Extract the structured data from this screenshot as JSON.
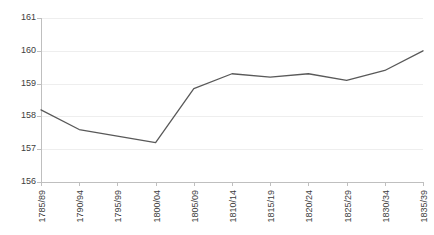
{
  "chart_data": {
    "type": "line",
    "title": "",
    "xlabel": "",
    "ylabel": "",
    "categories": [
      "1785/89",
      "1790/94",
      "1795/99",
      "1800/04",
      "1805/09",
      "1810/14",
      "1815/19",
      "1820/24",
      "1825/29",
      "1830/34",
      "1835/39"
    ],
    "series": [
      {
        "name": "height",
        "values": [
          158.2,
          157.6,
          157.4,
          157.2,
          158.85,
          159.3,
          159.2,
          159.3,
          159.1,
          159.4,
          160.0
        ]
      }
    ],
    "ylim": [
      156,
      161
    ],
    "yticks": [
      156,
      157,
      158,
      159,
      160,
      161
    ],
    "ytick_labels": [
      "156",
      "157",
      "158",
      "159",
      "160",
      "161"
    ],
    "grid": true,
    "legend": "none",
    "line_color": "#595959"
  },
  "colors": {
    "line": "#595959",
    "grid": "#eeeeee",
    "axis": "#bfbfbf",
    "text": "#404040",
    "background": "#ffffff"
  }
}
